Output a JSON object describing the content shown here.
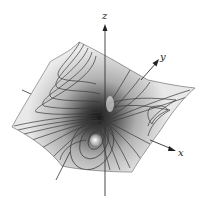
{
  "figure": {
    "type": "3d-surface-with-contours",
    "colors": {
      "background": "#ffffff",
      "surface_light": "#f2f2f2",
      "surface_mid": "#bdbdbd",
      "surface_dark": "#1e1e1e",
      "contour": "#3a3a3a",
      "axis": "#333333"
    }
  },
  "axes": {
    "x": {
      "label": "x"
    },
    "y": {
      "label": "y"
    },
    "z": {
      "label": "z"
    }
  }
}
